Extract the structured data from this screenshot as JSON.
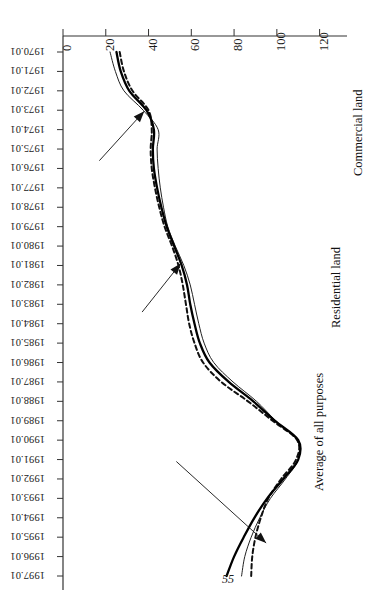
{
  "figure": {
    "page_number": "55",
    "orientation": "rotated-90-clockwise"
  },
  "annotations": [
    {
      "name": "average-of-all-purposes",
      "text": "Average of all purposes"
    },
    {
      "name": "residential-land",
      "text": "Residential land"
    },
    {
      "name": "commercial-land",
      "text": "Commercial land"
    }
  ],
  "chart_data": {
    "type": "line",
    "title": "",
    "subtitle": "",
    "xlabel": "",
    "ylabel": "",
    "grid": false,
    "legend": "annotated-callouts",
    "xlim": [
      "1970.01",
      "1997.01"
    ],
    "ylim": [
      0,
      130
    ],
    "yticks": [
      0,
      20,
      40,
      60,
      80,
      100,
      120
    ],
    "ytick_labels": [
      "0",
      "20",
      "40",
      "60",
      "80",
      "100",
      "120"
    ],
    "categories": [
      "1970.01",
      "1971.01",
      "1972.01",
      "1973.01",
      "1974.01",
      "1975.01",
      "1976.01",
      "1977.01",
      "1978.01",
      "1979.01",
      "1980.01",
      "1981.01",
      "1982.01",
      "1983.01",
      "1984.01",
      "1985.01",
      "1986.01",
      "1987.01",
      "1988.01",
      "1989.01",
      "1990.01",
      "1991.01",
      "1992.01",
      "1993.01",
      "1994.01",
      "1995.01",
      "1996.01",
      "1997.01"
    ],
    "series": [
      {
        "name": "Commercial land",
        "style": "thin-solid",
        "color": "#222222",
        "values": [
          22.0,
          24.5,
          28.5,
          37.5,
          44.5,
          44.0,
          44.5,
          45.5,
          47.0,
          49.0,
          52.5,
          56.5,
          59.5,
          61.5,
          63.5,
          66.0,
          70.5,
          79.5,
          90.5,
          99.5,
          109.5,
          110.0,
          104.0,
          97.0,
          92.0,
          88.0,
          85.0,
          83.5
        ]
      },
      {
        "name": "Residential land",
        "style": "dashed",
        "color": "#111111",
        "values": [
          26.5,
          28.5,
          32.5,
          40.0,
          41.5,
          41.0,
          41.5,
          43.0,
          45.0,
          47.5,
          51.0,
          54.0,
          56.0,
          57.5,
          59.0,
          61.5,
          65.5,
          74.0,
          86.5,
          98.0,
          109.5,
          109.0,
          102.0,
          96.0,
          92.5,
          90.0,
          88.5,
          88.0
        ]
      },
      {
        "name": "Average of all purposes",
        "style": "thick-solid",
        "color": "#000000",
        "values": [
          25.0,
          27.0,
          31.0,
          39.0,
          42.5,
          42.0,
          42.5,
          44.0,
          46.0,
          48.5,
          52.0,
          55.5,
          58.0,
          59.5,
          61.5,
          64.0,
          68.5,
          77.5,
          89.0,
          99.0,
          110.0,
          110.0,
          103.0,
          95.5,
          89.5,
          84.5,
          80.0,
          76.5
        ]
      }
    ]
  }
}
